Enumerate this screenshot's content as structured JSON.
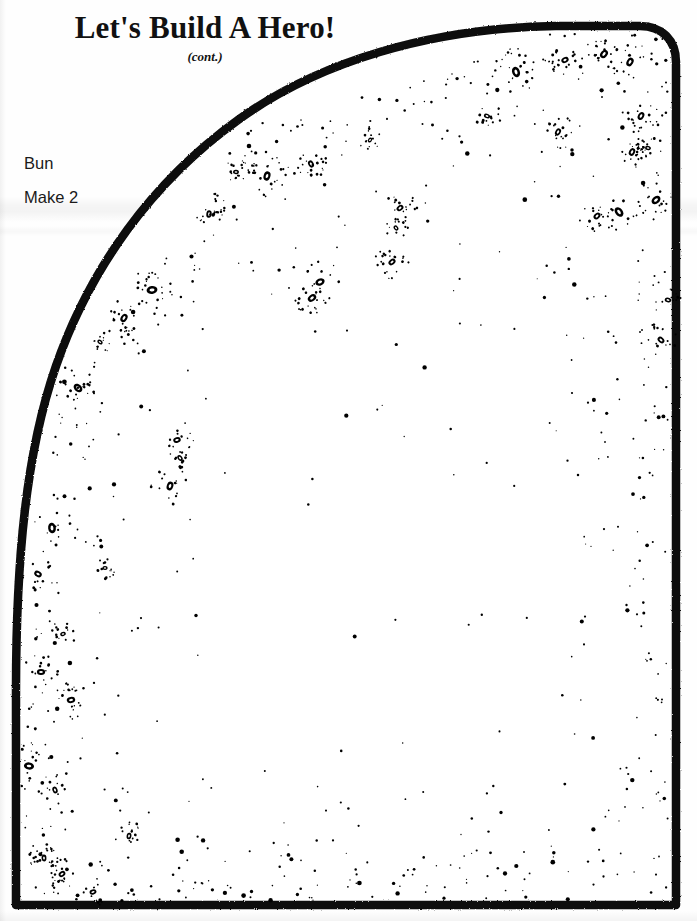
{
  "page": {
    "width": 697,
    "height": 921,
    "background_color": "#ffffff",
    "ink_color": "#000000",
    "document_type": "scanned craft sewing pattern sheet"
  },
  "header": {
    "title": "Let's Build A Hero!",
    "subtitle": "(cont.)"
  },
  "pattern_piece": {
    "name_label": "Bun",
    "quantity_label": "Make 2",
    "outline_color": "#000000",
    "outline_width_px": 8,
    "fill_color": "#ffffff",
    "description": "Dome / arch shaped bun pattern piece with sesame-seed stipple texture"
  },
  "texture": {
    "name": "sesame-seed-stipple",
    "seed_color": "#000000",
    "speckle_color": "#000000",
    "seed_count": 44,
    "speckle_count": 620
  },
  "shape_geometry": {
    "top_apex_y": 26,
    "bottom_edge_y": 909,
    "right_edge_x": 676,
    "left_edge_bottom_x": 16,
    "notes": "Large arc sweeping from lower-left up to top-right, rounded top-right corner, straight right edge, straight bottom edge"
  }
}
